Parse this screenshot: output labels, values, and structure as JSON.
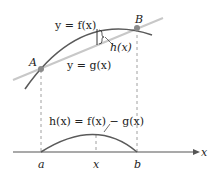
{
  "diagram": {
    "labels": {
      "f_curve": "y = f(x)",
      "g_line": "y = g(x)",
      "h_bracket": "h(x)",
      "point_A": "A",
      "point_B": "B",
      "h_formula": "h(x) = f(x) − g(x)",
      "axis_x": "x",
      "tick_a": "a",
      "tick_x": "x",
      "tick_b": "b"
    },
    "colors": {
      "curve": "#5a5a5a",
      "line": "#c8c8c8",
      "point": "#8a8a8a",
      "dashed": "#888888",
      "axis": "#555555"
    }
  }
}
